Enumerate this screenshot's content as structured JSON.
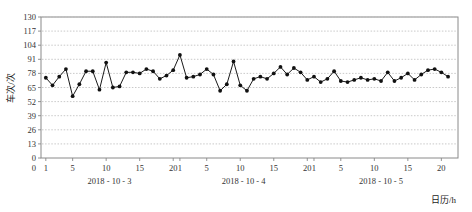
{
  "chart_data": {
    "type": "line",
    "title": "",
    "subtitle": "",
    "xlabel": "日历/h",
    "ylabel": "车次/次",
    "ylim": [
      0,
      130
    ],
    "yticks": [
      0,
      13,
      26,
      39,
      52,
      65,
      78,
      91,
      104,
      117,
      130
    ],
    "grid": true,
    "legend": null,
    "marker": "filled-circle",
    "line_color": "#1a1a1a",
    "marker_color": "#111111",
    "grid_color": "#bbbbbb",
    "axis_color": "#888888",
    "x_group_labels": [
      "2018 - 10 - 3",
      "2018 - 10 - 4",
      "2018 - 10 - 5"
    ],
    "x_hour_ticks": [
      1,
      5,
      10,
      15,
      20
    ],
    "x_tick_labels": [
      "1",
      "5",
      "10",
      "15",
      "20",
      "1",
      "5",
      "10",
      "15",
      "20",
      "1",
      "5",
      "10"
    ],
    "x": [
      1,
      2,
      3,
      4,
      5,
      6,
      7,
      8,
      9,
      10,
      11,
      12,
      13,
      14,
      15,
      16,
      17,
      18,
      19,
      20,
      21,
      22,
      23,
      24,
      25,
      26,
      27,
      28,
      29,
      30,
      31,
      32,
      33,
      34,
      35,
      36,
      37,
      38,
      39,
      40,
      41,
      42,
      43,
      44,
      45,
      46,
      47,
      48,
      49,
      50,
      51,
      52,
      53,
      54,
      55,
      56,
      57,
      58,
      59,
      60,
      61
    ],
    "values": [
      74,
      67,
      75,
      82,
      57,
      68,
      80,
      80,
      63,
      88,
      65,
      66,
      79,
      79,
      78,
      82,
      80,
      73,
      76,
      81,
      95,
      74,
      75,
      77,
      82,
      77,
      62,
      68,
      89,
      67,
      62,
      73,
      75,
      73,
      78,
      84,
      77,
      83,
      79,
      72,
      75,
      70,
      73,
      80,
      71,
      70,
      72,
      74,
      72,
      73,
      71,
      79,
      71,
      74,
      78,
      72,
      77,
      81,
      82,
      79,
      75
    ],
    "series": [
      {
        "name": "车次",
        "values": [
          74,
          67,
          75,
          82,
          57,
          68,
          80,
          80,
          63,
          88,
          65,
          66,
          79,
          79,
          78,
          82,
          80,
          73,
          76,
          81,
          95,
          74,
          75,
          77,
          82,
          77,
          62,
          68,
          89,
          67,
          62,
          73,
          75,
          73,
          78,
          84,
          77,
          83,
          79,
          72,
          75,
          70,
          73,
          80,
          71,
          70,
          72,
          74,
          72,
          73,
          71,
          79,
          71,
          74,
          78,
          72,
          77,
          81,
          82,
          79,
          75
        ]
      }
    ]
  },
  "figure": {
    "plot_left": 41,
    "plot_right": 458,
    "plot_top": 17,
    "plot_bottom": 158
  }
}
